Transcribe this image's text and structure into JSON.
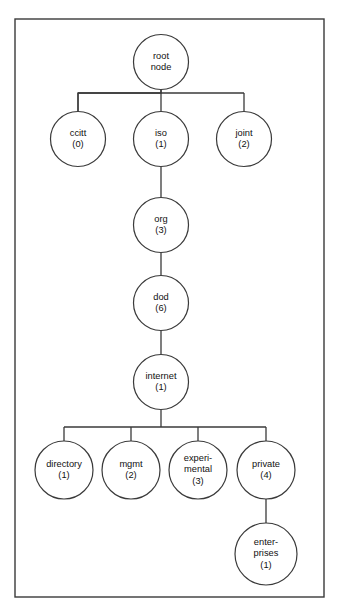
{
  "figure": {
    "frame": {
      "x": 15,
      "y": 19,
      "width": 309,
      "height": 578
    },
    "colors": {
      "background": "#ffffff",
      "stroke": "#3a3a3a",
      "node_fill": "#ffffff",
      "text": "#111111"
    }
  },
  "nodes": [
    {
      "id": "root",
      "lines": [
        "root",
        "node"
      ],
      "cx": 161,
      "cy": 62,
      "r": 27.5,
      "level": 0
    },
    {
      "id": "ccitt",
      "lines": [
        "ccitt",
        "(0)"
      ],
      "cx": 78,
      "cy": 139,
      "r": 27.5,
      "level": 1
    },
    {
      "id": "iso",
      "lines": [
        "iso",
        "(1)"
      ],
      "cx": 161,
      "cy": 139,
      "r": 27.5,
      "level": 1
    },
    {
      "id": "joint",
      "lines": [
        "joint",
        "(2)"
      ],
      "cx": 244,
      "cy": 139,
      "r": 27.5,
      "level": 1
    },
    {
      "id": "org",
      "lines": [
        "org",
        "(3)"
      ],
      "cx": 161,
      "cy": 225,
      "r": 27.5,
      "level": 2
    },
    {
      "id": "dod",
      "lines": [
        "dod",
        "(6)"
      ],
      "cx": 161,
      "cy": 303,
      "r": 27.5,
      "level": 3
    },
    {
      "id": "internet",
      "lines": [
        "internet",
        "(1)"
      ],
      "cx": 161,
      "cy": 382,
      "r": 27.5,
      "level": 4
    },
    {
      "id": "directory",
      "lines": [
        "directory",
        "(1)"
      ],
      "cx": 64,
      "cy": 470,
      "r": 29,
      "level": 5
    },
    {
      "id": "mgmt",
      "lines": [
        "mgmt",
        "(2)"
      ],
      "cx": 131,
      "cy": 470,
      "r": 29,
      "level": 5
    },
    {
      "id": "experimental",
      "lines": [
        "experi-",
        "mental",
        "(3)"
      ],
      "cx": 198,
      "cy": 470,
      "r": 29,
      "level": 5
    },
    {
      "id": "private",
      "lines": [
        "private",
        "(4)"
      ],
      "cx": 266,
      "cy": 470,
      "r": 29,
      "level": 5
    },
    {
      "id": "enterprises",
      "lines": [
        "enter-",
        "prises",
        "(1)"
      ],
      "cx": 266,
      "cy": 554,
      "r": 31,
      "level": 6
    }
  ],
  "edges": [
    {
      "id": "root-bus",
      "from": "root",
      "to": "level1-bus",
      "kind": "bus",
      "points": "161,89.5 161,93 78,93 78,111.5"
    },
    {
      "id": "root-ccitt",
      "from": "root",
      "to": "ccitt",
      "kind": "bus-leg",
      "points": "78,93 78,111.5"
    },
    {
      "id": "root-iso",
      "from": "root",
      "to": "iso",
      "kind": "straight",
      "points": "161,93 161,111.5"
    },
    {
      "id": "root-joint",
      "from": "root",
      "to": "joint",
      "kind": "bus-leg",
      "points": "244,93 244,111.5"
    },
    {
      "id": "level1-bar",
      "from": "bus",
      "to": "bus",
      "kind": "bar",
      "points": "78,93 244,93"
    },
    {
      "id": "root-stem",
      "from": "root",
      "to": "bus",
      "kind": "stem",
      "points": "161,89.5 161,93"
    },
    {
      "id": "iso-org",
      "from": "iso",
      "to": "org",
      "kind": "straight",
      "points": "161,166.5 161,197.5"
    },
    {
      "id": "org-dod",
      "from": "org",
      "to": "dod",
      "kind": "straight",
      "points": "161,252.5 161,275.5"
    },
    {
      "id": "dod-internet",
      "from": "dod",
      "to": "internet",
      "kind": "straight",
      "points": "161,330.5 161,354.5"
    },
    {
      "id": "internet-stem",
      "from": "internet",
      "to": "bus2",
      "kind": "stem",
      "points": "161,409.5 161,427"
    },
    {
      "id": "level5-bar",
      "from": "bus2",
      "to": "bus2",
      "kind": "bar",
      "points": "64,427 266,427"
    },
    {
      "id": "bus2-directory",
      "from": "bus2",
      "to": "directory",
      "kind": "bus-leg",
      "points": "64,427 64,441"
    },
    {
      "id": "bus2-mgmt",
      "from": "bus2",
      "to": "mgmt",
      "kind": "bus-leg",
      "points": "131,427 131,441"
    },
    {
      "id": "bus2-experimental",
      "from": "bus2",
      "to": "experimental",
      "kind": "bus-leg",
      "points": "198,427 198,441"
    },
    {
      "id": "bus2-private",
      "from": "bus2",
      "to": "private",
      "kind": "bus-leg",
      "points": "266,427 266,441"
    },
    {
      "id": "private-enterprises",
      "from": "private",
      "to": "enterprises",
      "kind": "straight",
      "points": "266,499 266,523"
    }
  ]
}
